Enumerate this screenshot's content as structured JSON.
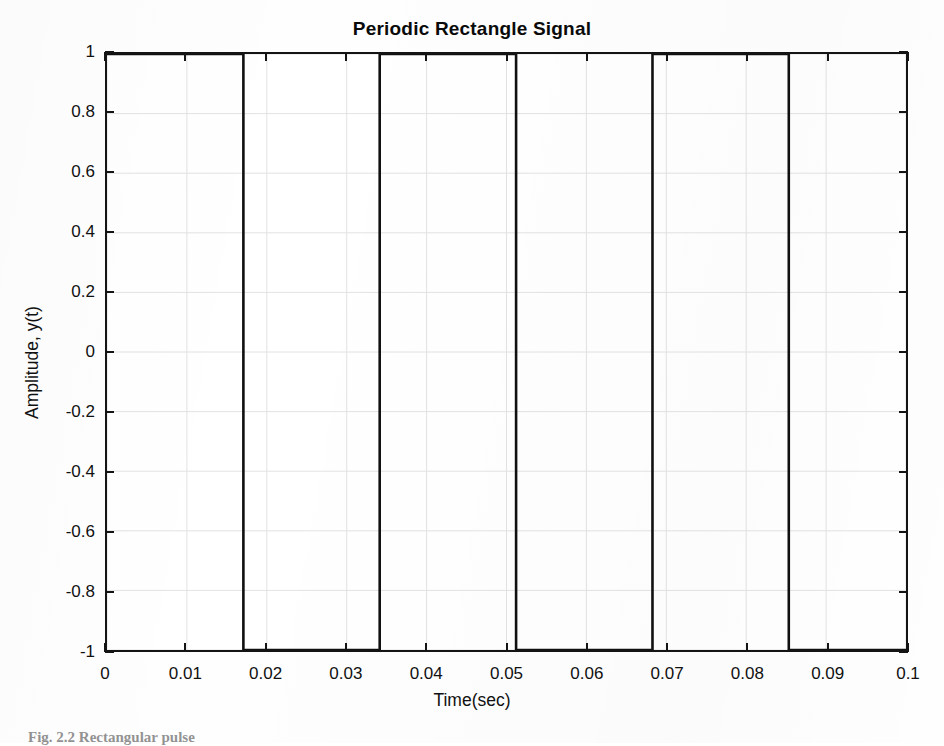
{
  "chart_data": {
    "type": "line",
    "title": "Periodic Rectangle Signal",
    "xlabel": "Time(sec)",
    "ylabel": "Amplitude, y(t)",
    "xlim": [
      0,
      0.1
    ],
    "ylim": [
      -1,
      1
    ],
    "grid": true,
    "legend": null,
    "xticks": [
      0,
      0.01,
      0.02,
      0.03,
      0.04,
      0.05,
      0.06,
      0.07,
      0.08,
      0.09,
      0.1
    ],
    "xticklabels": [
      "0",
      "0.01",
      "0.02",
      "0.03",
      "0.04",
      "0.05",
      "0.06",
      "0.07",
      "0.08",
      "0.09",
      "0.1"
    ],
    "yticks": [
      1,
      0.8,
      0.6,
      0.4,
      0.2,
      0,
      -0.2,
      -0.4,
      -0.6,
      -0.8,
      -1
    ],
    "yticklabels": [
      "1",
      "0.8",
      "0.6",
      "0.4",
      "0.2",
      "0",
      "-0.2",
      "-0.4",
      "-0.6",
      "-0.8",
      "-1"
    ],
    "series": [
      {
        "name": "y(t)",
        "color": "#101010",
        "linewidth": 2.6,
        "waveform": "square",
        "amplitude": 1,
        "high_value": 1,
        "low_value": -1,
        "period_sec": 0.03413,
        "frequency_hz": 29.3,
        "duty_cycle": 0.5,
        "transitions_sec": [
          0.01707,
          0.03413,
          0.0512,
          0.06827,
          0.08533
        ],
        "x": [
          0,
          0.01707,
          0.01707,
          0.03413,
          0.03413,
          0.0512,
          0.0512,
          0.06827,
          0.06827,
          0.08533,
          0.08533,
          0.1
        ],
        "y": [
          1,
          1,
          -1,
          -1,
          1,
          1,
          -1,
          -1,
          1,
          1,
          -1,
          -1
        ]
      }
    ]
  },
  "figure": {
    "title": "Periodic Rectangle Signal",
    "caption": "Fig. 2.2  Rectangular pulse"
  },
  "colors": {
    "trace": "#101010",
    "axis": "#141414",
    "grid": "#e2e2e2",
    "background": "#ffffff",
    "text": "#111111"
  }
}
